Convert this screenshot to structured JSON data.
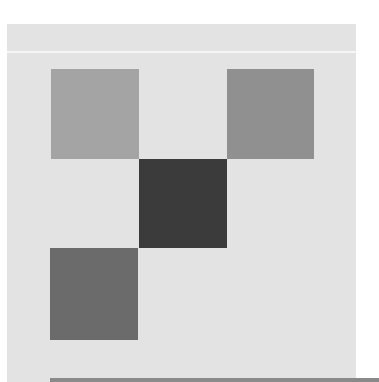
{
  "canvas": {
    "background": "#ffffff",
    "panel_color": "#e3e3e3",
    "divider_color": "#f6f6f6",
    "bottom_bar_color": "#8a8a8a"
  },
  "tiles": [
    {
      "name": "tile-top-left",
      "x": 51,
      "y": 69,
      "w": 88,
      "h": 90,
      "color": "#a4a4a4"
    },
    {
      "name": "tile-top-right",
      "x": 227,
      "y": 69,
      "w": 87,
      "h": 90,
      "color": "#909090"
    },
    {
      "name": "tile-center",
      "x": 139,
      "y": 159,
      "w": 88,
      "h": 89,
      "color": "#3b3b3b"
    },
    {
      "name": "tile-bottom-left",
      "x": 50,
      "y": 248,
      "w": 88,
      "h": 92,
      "color": "#6b6b6b"
    }
  ]
}
